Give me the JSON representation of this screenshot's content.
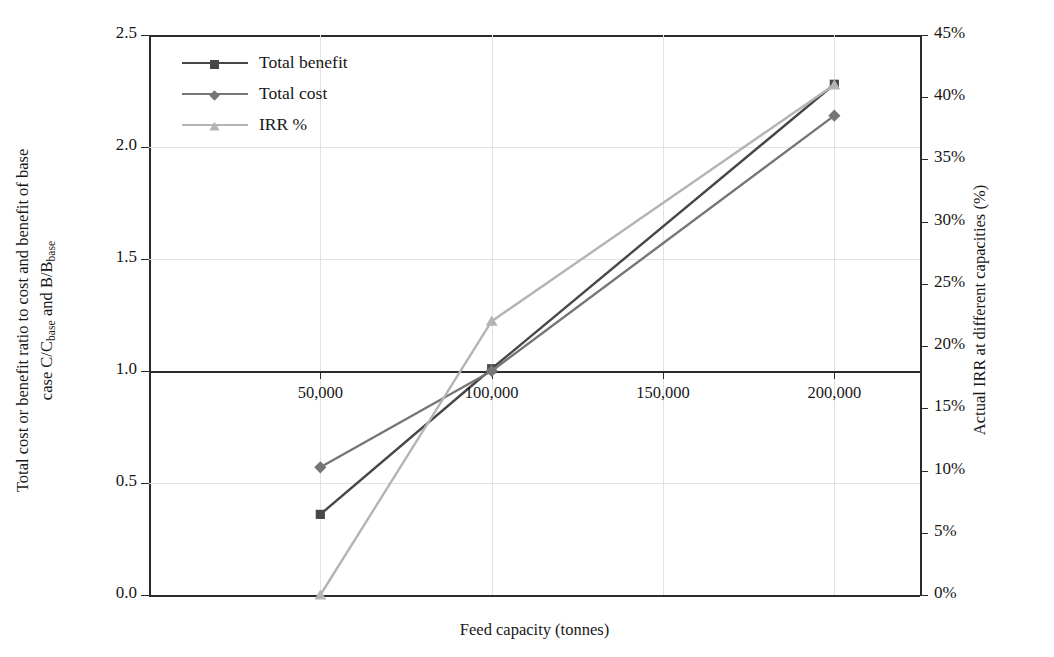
{
  "chart_data": {
    "type": "line",
    "title": "",
    "xlabel": "Feed capacity (tonnes)",
    "ylabel_left": "Total cost or benefit ratio to cost and benefit of base case C/C_base and B/B_base",
    "ylabel_right": "Actual IRR at different capacities (%)",
    "x": [
      50000,
      100000,
      200000
    ],
    "xticklabels": [
      "50,000",
      "100,000",
      "150,000",
      "200,000"
    ],
    "xtickvalues": [
      50000,
      100000,
      150000,
      200000
    ],
    "xlim": [
      0,
      225000
    ],
    "ylim_left": [
      0.0,
      2.5
    ],
    "yticklabels_left": [
      "0.0",
      "0.5",
      "1.0",
      "1.5",
      "2.0",
      "2.5"
    ],
    "ytickvalues_left": [
      0.0,
      0.5,
      1.0,
      1.5,
      2.0,
      2.5
    ],
    "ylim_right": [
      0,
      45
    ],
    "yticklabels_right": [
      "0%",
      "5%",
      "10%",
      "15%",
      "20%",
      "25%",
      "30%",
      "35%",
      "40%",
      "45%"
    ],
    "ytickvalues_right": [
      0,
      5,
      10,
      15,
      20,
      25,
      30,
      35,
      40,
      45
    ],
    "grid": true,
    "legend_position": "upper left",
    "series": [
      {
        "name": "Total benefit",
        "axis": "left",
        "marker": "square",
        "color": "#474747",
        "values": [
          0.36,
          1.01,
          2.28
        ]
      },
      {
        "name": "Total cost",
        "axis": "left",
        "marker": "diamond",
        "color": "#767676",
        "values": [
          0.57,
          1.0,
          2.14
        ]
      },
      {
        "name": "IRR %",
        "axis": "right",
        "marker": "triangle",
        "color": "#b4b4b4",
        "values": [
          0.0,
          22.0,
          41.0
        ]
      }
    ]
  },
  "axes": {
    "ylabel_left_line1": "Total cost or benefit ratio to cost and benefit of base",
    "ylabel_left_line2_a": "case C/C",
    "ylabel_left_line2_sub1": "base",
    "ylabel_left_line2_b": " and B/B",
    "ylabel_left_line2_sub2": "base",
    "ylabel_right": "Actual IRR at different capacities (%)",
    "xlabel": "Feed capacity (tonnes)"
  },
  "legend": {
    "items": [
      {
        "label": "Total benefit"
      },
      {
        "label": "Total cost"
      },
      {
        "label": "IRR %"
      }
    ]
  },
  "colors": {
    "axis": "#2b2b2b",
    "grid": "#e2e2e2",
    "series_total_benefit": "#474747",
    "series_total_cost": "#767676",
    "series_irr": "#b4b4b4",
    "background": "#ffffff"
  }
}
